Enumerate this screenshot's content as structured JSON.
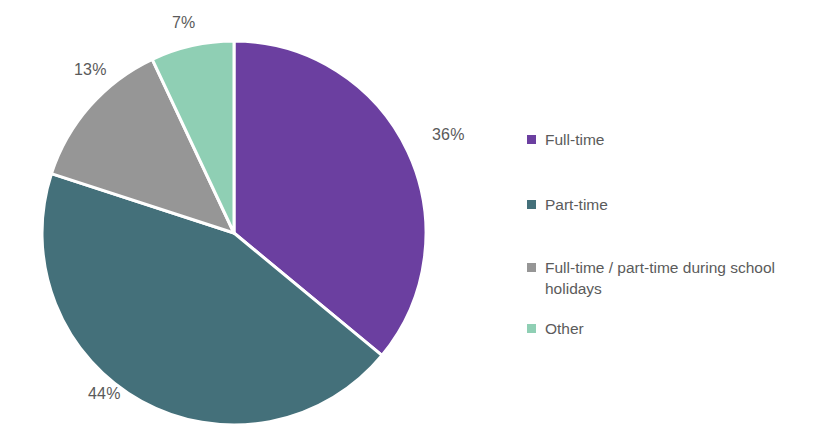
{
  "chart_data": {
    "type": "pie",
    "title": "",
    "subtitle": "",
    "xlabel": "",
    "ylabel": "",
    "grid": false,
    "legend_position": "right",
    "start_angle_deg": 0,
    "direction": "clockwise",
    "categories": [
      "Full-time",
      "Part-time",
      "Full-time / part-time during school holidays",
      "Other"
    ],
    "values": [
      36,
      44,
      13,
      7
    ],
    "value_unit": "%",
    "data_labels": [
      "36%",
      "44%",
      "13%",
      "7%"
    ],
    "colors": [
      "#6B3FA0",
      "#44707A",
      "#969696",
      "#8FCFB4"
    ],
    "slice_separator_color": "#ffffff"
  },
  "pie": {
    "slices": [
      {
        "label": "Full-time",
        "percent": 36,
        "data_label": "36%",
        "color": "#6B3FA0"
      },
      {
        "label": "Part-time",
        "percent": 44,
        "data_label": "44%",
        "color": "#44707A"
      },
      {
        "label": "Full-time / part-time during school holidays",
        "percent": 13,
        "data_label": "13%",
        "color": "#969696"
      },
      {
        "label": "Other",
        "percent": 7,
        "data_label": "7%",
        "color": "#8FCFB4"
      }
    ]
  },
  "legend": {
    "items": [
      {
        "label": "Full-time",
        "color": "#6B3FA0"
      },
      {
        "label": "Part-time",
        "color": "#44707A"
      },
      {
        "label": "Full-time / part-time during\nschool holidays",
        "color": "#969696"
      },
      {
        "label": "Other",
        "color": "#8FCFB4"
      }
    ]
  },
  "style": {
    "background": "#ffffff",
    "text_color": "#5b5b5b"
  }
}
